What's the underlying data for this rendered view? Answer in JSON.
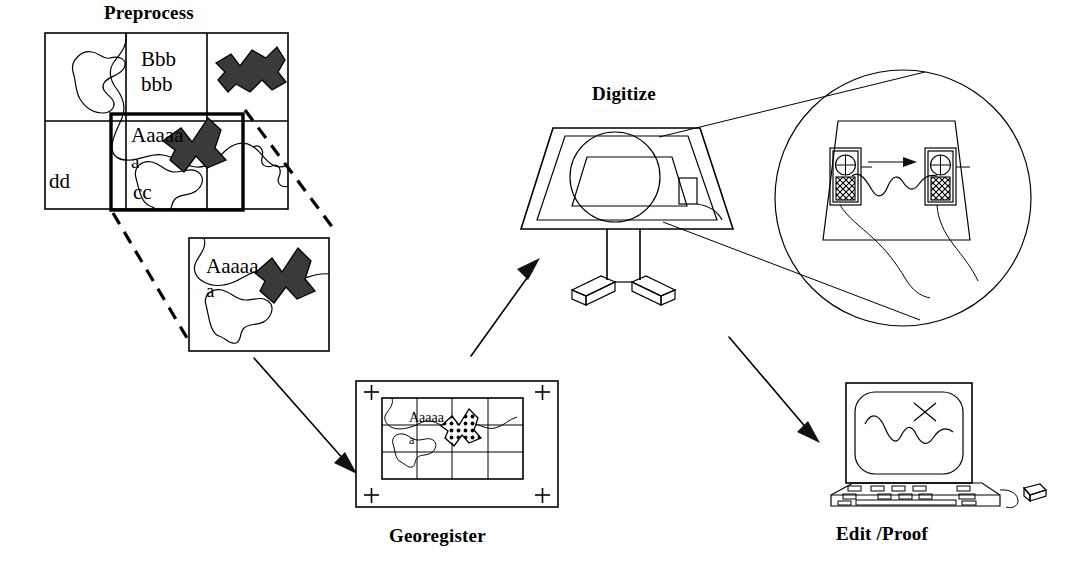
{
  "diagram": {
    "type": "process-flow-diagram",
    "background_color": "#ffffff",
    "line_color": "#000000",
    "fill_color": "#3a3a3a"
  },
  "stages": [
    {
      "id": "preprocess",
      "label": "Preprocess",
      "label_position": "top-left",
      "description": "Source map sheet with grid, annotations and a highlighted area of interest, enlarged below"
    },
    {
      "id": "georegister",
      "label": "Georegister",
      "label_position": "bottom-center",
      "description": "Map sheet with four corner registration tick marks and an overlaid coordinate grid"
    },
    {
      "id": "digitize",
      "label": "Digitize",
      "label_position": "top-center",
      "description": "Digitizing tablet on a pedestal stand with magnified callout of the cursor puck"
    },
    {
      "id": "editproof",
      "label": "Edit /Proof",
      "label_position": "bottom-right",
      "description": "Computer workstation with monitor, keyboard and mouse showing edited line work"
    }
  ],
  "preprocess_map": {
    "grid_columns": 3,
    "grid_rows": 2,
    "annotations": [
      {
        "text": "Bbb",
        "cell": "top-center"
      },
      {
        "text": "bbb",
        "cell": "top-center"
      },
      {
        "text": "dd",
        "cell": "bottom-left"
      },
      {
        "text": "Aaaaa",
        "cell": "center"
      },
      {
        "text": "a",
        "cell": "center"
      },
      {
        "text": "cc",
        "cell": "bottom-center"
      }
    ],
    "highlight_box": "thick rectangle marking the area of interest",
    "polygons": [
      {
        "name": "filled-polygon-top-right",
        "fill": "solid"
      },
      {
        "name": "filled-polygon-center",
        "fill": "solid"
      }
    ]
  },
  "detail_panel": {
    "annotations": [
      {
        "text": "Aaaaa"
      },
      {
        "text": "a"
      }
    ],
    "callout_style": "dashed",
    "description": "Enlarged view of the highlighted map area"
  },
  "georegister_map": {
    "registration_marks": [
      "+",
      "+",
      "+",
      "+"
    ],
    "registration_mark_count": 4,
    "grid_columns": 4,
    "grid_rows": 3,
    "annotations": [
      {
        "text": "Aaaaa"
      },
      {
        "text": "a"
      }
    ],
    "polygon_fill": "dotted"
  },
  "digitize_station": {
    "device": "digitizing tablet",
    "mount": "pedestal stand with tripod base",
    "magnifier": {
      "shape": "circle",
      "callout_style": "tangent-lines",
      "contents": {
        "cursor_count": 2,
        "cursor_name": "digitizer puck",
        "motion_arrow": "right",
        "traced_line": "wavy map feature being traced"
      }
    }
  },
  "editproof_station": {
    "components": [
      "monitor",
      "keyboard",
      "mouse"
    ],
    "screen_contents": "wavy line work with an X edit mark"
  },
  "flow_arrows": [
    {
      "from": "preprocess-detail",
      "to": "georegister",
      "direction": "down-right",
      "style": "solid"
    },
    {
      "from": "georegister",
      "to": "digitize",
      "direction": "up-right",
      "style": "solid"
    },
    {
      "from": "digitize",
      "to": "editproof",
      "direction": "down-right",
      "style": "solid"
    }
  ],
  "callout_lines": [
    {
      "from": "preprocess-highlight-box",
      "to": "detail-panel",
      "style": "dashed"
    },
    {
      "from": "digitize-tablet",
      "to": "magnifier-circle",
      "style": "solid-tangent"
    }
  ]
}
